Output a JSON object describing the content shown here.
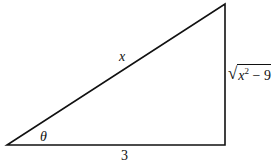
{
  "diagram": {
    "type": "right-triangle",
    "vertices": {
      "bottom_left": [
        7,
        145
      ],
      "bottom_right": [
        225,
        145
      ],
      "top_right": [
        225,
        4
      ]
    },
    "stroke_color": "#111111",
    "labels": {
      "hypotenuse": "x",
      "angle": "θ",
      "adjacent": "3",
      "opposite_radical": "√",
      "opposite_var": "x",
      "opposite_exp": "2",
      "opposite_rest": " − 9"
    }
  }
}
